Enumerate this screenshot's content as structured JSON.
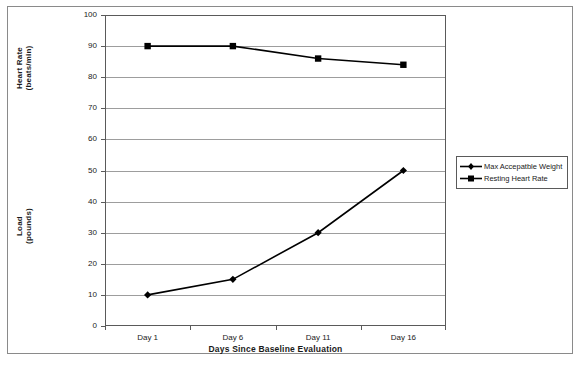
{
  "chart_data": {
    "type": "line",
    "title": "",
    "xlabel": "Days Since Baseline Evaluation",
    "ylabel": "",
    "categories": [
      "Day 1",
      "Day 6",
      "Day 11",
      "Day 16"
    ],
    "ylim": [
      0,
      100
    ],
    "ytick_step": 10,
    "yticks": [
      100,
      90,
      80,
      70,
      60,
      50,
      40,
      30,
      20,
      10,
      0
    ],
    "grid": "horizontal",
    "legend_position": "right",
    "axis_titles": {
      "heart_rate_line1": "Heart Rate",
      "heart_rate_line2": "(beats/min)",
      "load_line1": "Load",
      "load_line2": "(pounds)"
    },
    "series": [
      {
        "name": "Max Accepatble Weight",
        "marker": "diamond",
        "color": "#000000",
        "unit": "pounds",
        "values": [
          10,
          15,
          30,
          50
        ]
      },
      {
        "name": "Resting Heart Rate",
        "marker": "square",
        "color": "#000000",
        "unit": "beats/min",
        "values": [
          90,
          90,
          86,
          84
        ]
      }
    ]
  },
  "legend": {
    "items": [
      {
        "label": "Max Accepatble Weight",
        "marker": "diamond"
      },
      {
        "label": "Resting Heart Rate",
        "marker": "square"
      }
    ]
  }
}
